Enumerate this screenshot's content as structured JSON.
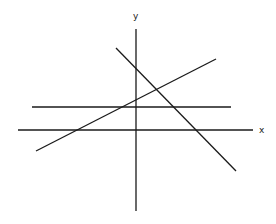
{
  "diagram": {
    "axes": {
      "x_label": "x",
      "y_label": "y",
      "color": "#1a1a1a"
    },
    "lines": [
      {
        "name": "horizontal-line",
        "x1": 32,
        "y1": 107,
        "x2": 231,
        "y2": 107
      },
      {
        "name": "rising-line",
        "x1": 36,
        "y1": 151,
        "x2": 216,
        "y2": 59
      },
      {
        "name": "falling-line",
        "x1": 116,
        "y1": 48,
        "x2": 236,
        "y2": 171
      }
    ]
  }
}
